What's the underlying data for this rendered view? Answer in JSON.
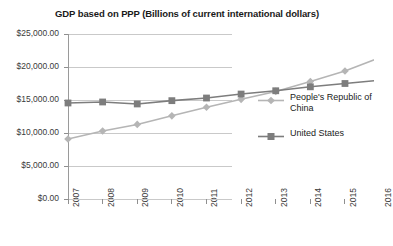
{
  "chart_data": {
    "type": "line",
    "title": "GDP based on PPP (Billions of current international dollars)",
    "xlabel": "",
    "ylabel": "",
    "categories": [
      "2007",
      "2008",
      "2009",
      "2010",
      "2011",
      "2012",
      "2013",
      "2014",
      "2015",
      "2016"
    ],
    "series": [
      {
        "name": "People's Republic of China",
        "color": "#b5b5b5",
        "marker": "diamond",
        "values": [
          9090,
          10300,
          11300,
          12600,
          13900,
          15100,
          16300,
          17800,
          19400,
          21400
        ]
      },
      {
        "name": "United States",
        "color": "#7d7d7d",
        "marker": "square",
        "values": [
          14550,
          14700,
          14400,
          14900,
          15300,
          15900,
          16400,
          17000,
          17500,
          18000
        ]
      }
    ],
    "ylim": [
      0,
      25000
    ],
    "yticks": [
      0,
      5000,
      10000,
      15000,
      20000,
      25000
    ],
    "ytick_labels": [
      "$0.00",
      "$5,000.00",
      "$10,000.00",
      "$15,000.00",
      "$20,000.00",
      "$25,000.00"
    ],
    "grid": true,
    "legend_position": "right"
  },
  "legend": {
    "entries": [
      {
        "label": "People's Republic of China"
      },
      {
        "label": "United States"
      }
    ]
  }
}
